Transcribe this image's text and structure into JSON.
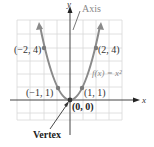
{
  "figure": {
    "function_label": "f(x) = x²",
    "axis_callout": "Axis",
    "vertex_callout": "Vertex",
    "x_axis_label": "x",
    "y_axis_label": "y",
    "points": [
      {
        "label": "(−2, 4)",
        "x": -2,
        "y": 4
      },
      {
        "label": "(−1, 1)",
        "x": -1,
        "y": 1
      },
      {
        "label": "(0, 0)",
        "x": 0,
        "y": 0
      },
      {
        "label": "(1, 1)",
        "x": 1,
        "y": 1
      },
      {
        "label": "(2, 4)",
        "x": 2,
        "y": 4
      }
    ],
    "colors": {
      "curve": "#8a8a8a",
      "grid": "#d8d8d8",
      "axes": "#333333",
      "points": "#7a7a7a"
    }
  }
}
